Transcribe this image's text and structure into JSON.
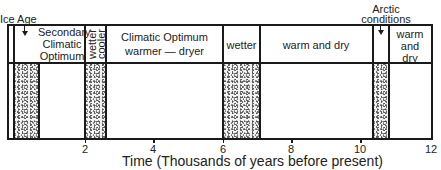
{
  "diagram": {
    "annotations": {
      "ice_age": "Ice Age",
      "arctic_conditions_line1": "Arctic",
      "arctic_conditions_line2": "conditions"
    },
    "periods": [
      {
        "label_lines": [
          "Secondary",
          "Climatic",
          "Optimum"
        ],
        "start_kyr": 0.6,
        "end_kyr": 2.0,
        "stippled": false
      },
      {
        "label_lines": [
          "wetter",
          "cooler"
        ],
        "start_kyr": 2.0,
        "end_kyr": 2.6,
        "stippled": true,
        "vertical_text": true
      },
      {
        "label_lines": [
          "Climatic Optimum",
          "warmer — dryer"
        ],
        "start_kyr": 2.6,
        "end_kyr": 6.0,
        "stippled": false
      },
      {
        "label_lines": [
          "wetter"
        ],
        "start_kyr": 6.0,
        "end_kyr": 7.1,
        "stippled": true
      },
      {
        "label_lines": [
          "warm and dry"
        ],
        "start_kyr": 7.1,
        "end_kyr": 10.4,
        "stippled": false
      },
      {
        "label_lines": [
          ""
        ],
        "start_kyr": 10.4,
        "end_kyr": 10.9,
        "stippled": true,
        "note": "Arctic conditions"
      },
      {
        "label_lines": [
          "warm",
          "and",
          "dry"
        ],
        "start_kyr": 10.9,
        "end_kyr": 12.0,
        "stippled": false
      }
    ],
    "ice_age_band": {
      "start_kyr": 0.0,
      "end_kyr": 0.6,
      "stippled": true
    },
    "axis": {
      "ticks": [
        "2",
        "4",
        "6",
        "8",
        "10",
        "12"
      ],
      "title": "Time  (Thousands of years before present)"
    }
  }
}
